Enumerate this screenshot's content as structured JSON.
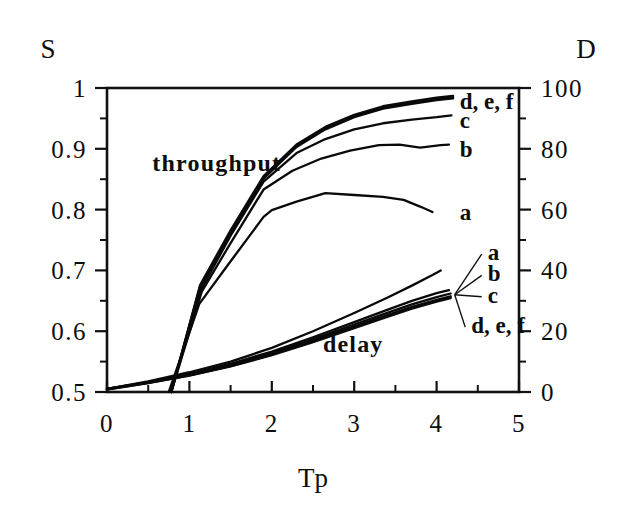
{
  "figure": {
    "left_axis_title": "S",
    "right_axis_title": "D",
    "x_axis_title": "Tp",
    "throughput_group_label": "throughput",
    "delay_group_label": "delay"
  },
  "chart_data": {
    "type": "line",
    "title": "",
    "xlabel": "Tp",
    "ylabel": "S",
    "y2label": "D",
    "xlim": [
      0,
      5
    ],
    "ylim": [
      0.5,
      1
    ],
    "y2lim": [
      0,
      100
    ],
    "grid": false,
    "legend": "inline-end-labels",
    "x_ticks": [
      "0",
      "1",
      "2",
      "3",
      "4",
      "5"
    ],
    "x_tick_values": [
      0,
      1,
      2,
      3,
      4,
      5
    ],
    "x_minor_step": 0.5,
    "y_ticks": [
      "0.5",
      "0.6",
      "0.7",
      "0.8",
      "0.9",
      "1"
    ],
    "y_tick_values": [
      0.5,
      0.6,
      0.7,
      0.8,
      0.9,
      1
    ],
    "y_minor_step": 0.05,
    "y2_ticks": [
      "0",
      "20",
      "40",
      "60",
      "80",
      "100"
    ],
    "y2_tick_values": [
      0,
      20,
      40,
      60,
      80,
      100
    ],
    "y2_minor_step": 10,
    "groups": [
      {
        "name": "throughput",
        "axis": "left",
        "label_text": "throughput",
        "series": [
          {
            "name": "a",
            "label": "a",
            "x": [
              0.75,
              1.12,
              1.5,
              1.9,
              2.0,
              2.3,
              2.65,
              3.0,
              3.35,
              3.6,
              3.8,
              3.95
            ],
            "y": [
              0.5,
              0.645,
              0.715,
              0.788,
              0.799,
              0.813,
              0.827,
              0.824,
              0.821,
              0.816,
              0.805,
              0.796
            ]
          },
          {
            "name": "b",
            "label": "b",
            "x": [
              0.78,
              1.15,
              1.5,
              1.9,
              2.25,
              2.6,
              2.95,
              3.3,
              3.55,
              3.8,
              4.05,
              4.15
            ],
            "y": [
              0.5,
              0.665,
              0.745,
              0.833,
              0.864,
              0.884,
              0.897,
              0.906,
              0.907,
              0.902,
              0.906,
              0.907
            ]
          },
          {
            "name": "c",
            "label": "c",
            "x": [
              0.78,
              1.14,
              1.5,
              1.9,
              2.3,
              2.65,
              3.0,
              3.35,
              3.7,
              4.0,
              4.18
            ],
            "y": [
              0.5,
              0.668,
              0.757,
              0.846,
              0.893,
              0.916,
              0.932,
              0.942,
              0.948,
              0.952,
              0.955
            ]
          },
          {
            "name": "d",
            "label": "d, e, f",
            "x": [
              0.78,
              1.13,
              1.5,
              1.9,
              2.3,
              2.65,
              3.0,
              3.35,
              3.7,
              4.0,
              4.2
            ],
            "y": [
              0.5,
              0.672,
              0.762,
              0.851,
              0.903,
              0.932,
              0.952,
              0.966,
              0.974,
              0.98,
              0.983
            ]
          },
          {
            "name": "e",
            "label": "",
            "x": [
              0.78,
              1.13,
              1.5,
              1.9,
              2.3,
              2.65,
              3.0,
              3.35,
              3.7,
              4.0,
              4.2
            ],
            "y": [
              0.5,
              0.674,
              0.764,
              0.853,
              0.905,
              0.934,
              0.954,
              0.968,
              0.976,
              0.982,
              0.985
            ]
          },
          {
            "name": "f",
            "label": "",
            "x": [
              0.78,
              1.13,
              1.5,
              1.9,
              2.3,
              2.65,
              3.0,
              3.35,
              3.7,
              4.0,
              4.2
            ],
            "y": [
              0.5,
              0.676,
              0.766,
              0.855,
              0.907,
              0.936,
              0.956,
              0.97,
              0.978,
              0.984,
              0.987
            ]
          }
        ],
        "end_labels": [
          {
            "text": "d, e, f",
            "x": 4.28,
            "y": 0.978
          },
          {
            "text": "c",
            "x": 4.28,
            "y": 0.948
          },
          {
            "text": "b",
            "x": 4.28,
            "y": 0.9
          },
          {
            "text": "a",
            "x": 4.28,
            "y": 0.796
          }
        ]
      },
      {
        "name": "delay",
        "axis": "right",
        "label_text": "delay",
        "series": [
          {
            "name": "a",
            "label": "a",
            "x": [
              0.0,
              0.5,
              1.0,
              1.5,
              2.0,
              2.5,
              3.0,
              3.4,
              3.7,
              3.95,
              4.05
            ],
            "y": [
              1.0,
              3.5,
              6.5,
              10.0,
              14.5,
              20.0,
              26.0,
              31.0,
              35.0,
              38.5,
              40.0
            ]
          },
          {
            "name": "b",
            "label": "b",
            "x": [
              0.0,
              0.5,
              1.0,
              1.5,
              2.0,
              2.5,
              3.0,
              3.4,
              3.7,
              4.0,
              4.15
            ],
            "y": [
              1.0,
              3.3,
              6.0,
              9.3,
              13.3,
              18.0,
              23.0,
              27.0,
              30.0,
              32.5,
              33.5
            ]
          },
          {
            "name": "c",
            "label": "c",
            "x": [
              0.0,
              0.5,
              1.0,
              1.5,
              2.0,
              2.5,
              3.0,
              3.4,
              3.7,
              4.0,
              4.17
            ],
            "y": [
              1.0,
              3.2,
              5.8,
              9.0,
              12.9,
              17.4,
              22.2,
              26.0,
              28.8,
              31.2,
              32.4
            ]
          },
          {
            "name": "d",
            "label": "d, e, f",
            "x": [
              0.0,
              0.5,
              1.0,
              1.5,
              2.0,
              2.5,
              3.0,
              3.4,
              3.7,
              4.0,
              4.17
            ],
            "y": [
              1.0,
              3.1,
              5.6,
              8.7,
              12.5,
              16.9,
              21.6,
              25.3,
              28.0,
              30.3,
              31.5
            ]
          },
          {
            "name": "e",
            "label": "",
            "x": [
              0.0,
              0.5,
              1.0,
              1.5,
              2.0,
              2.5,
              3.0,
              3.4,
              3.7,
              4.0,
              4.17
            ],
            "y": [
              0.9,
              3.0,
              5.5,
              8.5,
              12.3,
              16.6,
              21.3,
              25.0,
              27.7,
              30.0,
              31.2
            ]
          },
          {
            "name": "f",
            "label": "",
            "x": [
              0.0,
              0.5,
              1.0,
              1.5,
              2.0,
              2.5,
              3.0,
              3.4,
              3.7,
              4.0,
              4.17
            ],
            "y": [
              0.8,
              2.9,
              5.4,
              8.4,
              12.1,
              16.4,
              21.0,
              24.7,
              27.4,
              29.7,
              30.9
            ]
          }
        ],
        "end_labels": [
          {
            "text": "a",
            "x": 4.62,
            "y": 46.0
          },
          {
            "text": "b",
            "x": 4.62,
            "y": 39.0
          },
          {
            "text": "c",
            "x": 4.62,
            "y": 32.0
          },
          {
            "text": "d, e, f",
            "x": 4.42,
            "y": 22.0
          }
        ],
        "leader_origin": {
          "x": 4.22,
          "y": 32.0
        }
      }
    ],
    "annotations": [
      {
        "text": "throughput",
        "x": 0.55,
        "y_left": 0.863
      },
      {
        "text": "delay",
        "x": 2.62,
        "y_right": 13.0
      }
    ]
  },
  "colors": {
    "ink": "#0d0d0d",
    "background": "#ffffff"
  }
}
